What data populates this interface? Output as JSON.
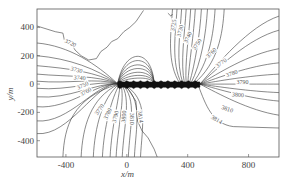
{
  "chart_data": {
    "type": "contour",
    "title": "",
    "xlabel": "x/m",
    "ylabel": "y/m",
    "xlim": [
      -590,
      1000
    ],
    "ylim": [
      -515,
      530
    ],
    "xticks": [
      -400,
      0,
      400,
      800
    ],
    "yticks": [
      400,
      200,
      0,
      -200,
      -400
    ],
    "xtick_labels": [
      "-400",
      "0",
      "400",
      "800"
    ],
    "ytick_labels": [
      "400",
      "200",
      "0",
      "-200",
      "-400"
    ],
    "grid": false,
    "legend": null,
    "contour_levels": [
      3720,
      3725,
      3730,
      3740,
      3750,
      3760,
      3770,
      3780,
      3790,
      3800,
      3810,
      3814
    ],
    "contour_labels": [
      {
        "text": "3720",
        "x": -370,
        "y": 290,
        "angle": 25
      },
      {
        "text": "3730",
        "x": -330,
        "y": 100,
        "angle": 15
      },
      {
        "text": "3740",
        "x": -310,
        "y": 45,
        "angle": 5
      },
      {
        "text": "3750",
        "x": -290,
        "y": -10,
        "angle": -25
      },
      {
        "text": "3760",
        "x": -270,
        "y": -55,
        "angle": -30
      },
      {
        "text": "3770",
        "x": -180,
        "y": -180,
        "angle": -55
      },
      {
        "text": "3780",
        "x": -125,
        "y": -210,
        "angle": -65
      },
      {
        "text": "3790",
        "x": -75,
        "y": -230,
        "angle": -75
      },
      {
        "text": "3800",
        "x": -20,
        "y": -230,
        "angle": -85
      },
      {
        "text": "3810",
        "x": 35,
        "y": -245,
        "angle": 90
      },
      {
        "text": "3814",
        "x": 90,
        "y": -230,
        "angle": 80
      },
      {
        "text": "3725",
        "x": 305,
        "y": 415,
        "angle": -80
      },
      {
        "text": "3730",
        "x": 350,
        "y": 375,
        "angle": -75
      },
      {
        "text": "3740",
        "x": 400,
        "y": 330,
        "angle": -65
      },
      {
        "text": "3750",
        "x": 460,
        "y": 280,
        "angle": -55
      },
      {
        "text": "3760",
        "x": 555,
        "y": 220,
        "angle": -45
      },
      {
        "text": "3770",
        "x": 620,
        "y": 150,
        "angle": -35
      },
      {
        "text": "3780",
        "x": 690,
        "y": 75,
        "angle": -20
      },
      {
        "text": "3790",
        "x": 760,
        "y": 15,
        "angle": 0
      },
      {
        "text": "3800",
        "x": 730,
        "y": -75,
        "angle": 5
      },
      {
        "text": "3810",
        "x": 660,
        "y": -175,
        "angle": 20
      },
      {
        "text": "3814",
        "x": 590,
        "y": -250,
        "angle": 30
      }
    ],
    "features": {
      "dense_band": {
        "x_from": -60,
        "x_to": 480,
        "y": 0,
        "description": "high-gradient black band along y=0"
      }
    }
  }
}
